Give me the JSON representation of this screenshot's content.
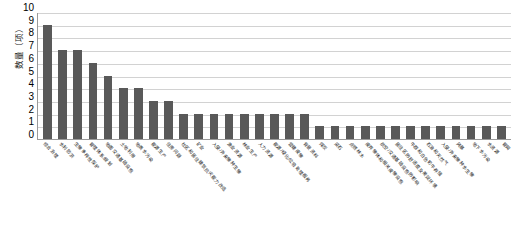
{
  "chart_data": {
    "type": "bar",
    "title": "",
    "subtitle": "",
    "xlabel": "",
    "ylabel": "数量（项）",
    "ylim": [
      0,
      10
    ],
    "yticks": [
      10,
      9,
      8,
      7,
      6,
      5,
      4,
      3,
      2,
      1,
      0
    ],
    "grid": true,
    "legend": false,
    "legend_position": "none",
    "bar_color": "#595959",
    "orientation": "vertical",
    "categories": [
      "综合治理",
      "水利防洪",
      "生物多样性保护",
      "管理体系/规划",
      "地面交通基础设施",
      "土地利用",
      "地表水污染",
      "能源生产",
      "住房问题",
      "社区和居住建筑抗灾能力改造",
      "矿业",
      "入侵/外来物种生物",
      "渔业资源",
      "林业生产",
      "人力资源",
      "能源/绿化/垃圾处理服务",
      "营建废物",
      "背景资料",
      "煤炭",
      "采石",
      "点燃林木",
      "废弃物体和相关废物设施",
      "航空/交通基础设施的影响",
      "居住区的舒适度及美观环境",
      "牛群和白色奶牛养殖",
      "石油和天然气",
      "入侵/外来物种水生物",
      "风暴",
      "地下水污染",
      "水资源",
      "管网"
    ],
    "values": [
      9,
      7,
      7,
      6,
      5,
      4,
      4,
      3,
      3,
      2,
      2,
      2,
      2,
      2,
      2,
      2,
      2,
      2,
      1,
      1,
      1,
      1,
      1,
      1,
      1,
      1,
      1,
      1,
      1,
      1,
      1
    ]
  }
}
